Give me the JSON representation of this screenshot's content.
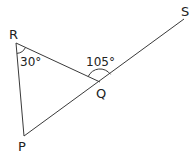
{
  "diagram": {
    "title": "",
    "type": "geometry-triangle",
    "points": {
      "R": {
        "label": "R",
        "x": 16,
        "y": 43
      },
      "Q": {
        "label": "Q",
        "x": 100,
        "y": 82
      },
      "P": {
        "label": "P",
        "x": 24,
        "y": 136
      },
      "S": {
        "label": "S",
        "x": 184,
        "y": 19
      }
    },
    "segments": [
      {
        "from": "R",
        "to": "Q"
      },
      {
        "from": "R",
        "to": "P"
      },
      {
        "from": "P",
        "to": "S",
        "note": "straight line through Q"
      }
    ],
    "angles": [
      {
        "vertex": "R",
        "between": [
          "P",
          "Q"
        ],
        "value_label": "30°"
      },
      {
        "vertex": "Q",
        "between": [
          "R",
          "S"
        ],
        "value_label": "105°"
      }
    ],
    "colors": {
      "line": "#3a3a3a",
      "text": "#222222",
      "background": "#ffffff"
    }
  }
}
